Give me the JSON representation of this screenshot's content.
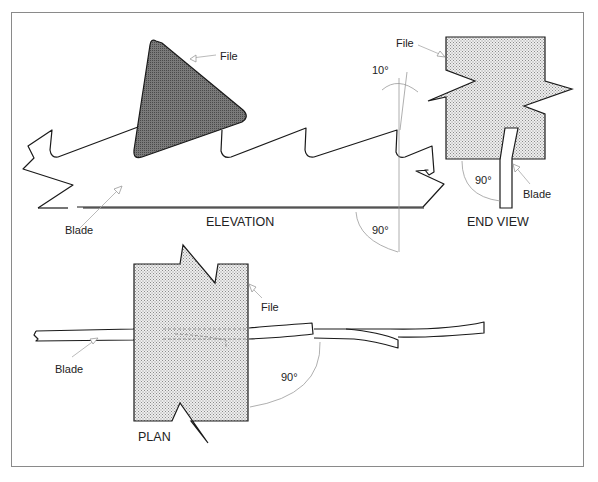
{
  "figure": {
    "colors": {
      "ink": "#1a1a1a",
      "leader": "#a8a8a8",
      "file_solid": "#6e6e6e",
      "file_stipple": "#d6d6d6",
      "frame": "#8a8a8a"
    }
  },
  "elevation": {
    "title": "ELEVATION",
    "file_label": "File",
    "blade_label": "Blade",
    "angle_top": "10°",
    "angle_bottom": "90°"
  },
  "end_view": {
    "title": "END VIEW",
    "file_label": "File",
    "blade_label": "Blade",
    "angle": "90°"
  },
  "plan": {
    "title": "PLAN",
    "file_label": "File",
    "blade_label": "Blade",
    "angle": "90°"
  }
}
